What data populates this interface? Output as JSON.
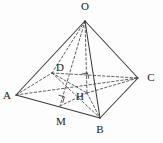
{
  "figure": {
    "stroke_color": "#3a3a3a",
    "label_color": "#1a1a1a",
    "background": "#fdfdfd",
    "vertices": [
      {
        "name": "O",
        "label": "O",
        "x": 85,
        "y": 21,
        "lx": 85,
        "ly": 7,
        "anchor": "middle"
      },
      {
        "name": "A",
        "label": "A",
        "x": 16,
        "y": 95,
        "lx": 7,
        "ly": 96,
        "anchor": "middle"
      },
      {
        "name": "B",
        "label": "B",
        "x": 100,
        "y": 118,
        "lx": 100,
        "ly": 130,
        "anchor": "middle"
      },
      {
        "name": "C",
        "label": "C",
        "x": 138,
        "y": 78,
        "lx": 151,
        "ly": 78,
        "anchor": "middle"
      },
      {
        "name": "D",
        "label": "D",
        "x": 52,
        "y": 73,
        "lx": 60,
        "ly": 68,
        "anchor": "middle"
      },
      {
        "name": "H",
        "label": "H",
        "x": 87,
        "y": 93,
        "lx": 80,
        "ly": 97,
        "anchor": "middle"
      },
      {
        "name": "M",
        "label": "M",
        "x": 60,
        "y": 106,
        "lx": 61,
        "ly": 122,
        "anchor": "middle"
      }
    ],
    "solid_edges": [
      {
        "name": "edge-OA",
        "from": "O",
        "to": "A"
      },
      {
        "name": "edge-OB",
        "from": "O",
        "to": "B"
      },
      {
        "name": "edge-OC",
        "from": "O",
        "to": "C"
      },
      {
        "name": "edge-AB",
        "from": "A",
        "to": "B"
      },
      {
        "name": "edge-BC",
        "from": "B",
        "to": "C"
      }
    ],
    "dashed_edges": [
      {
        "name": "edge-OD",
        "from": "O",
        "to": "D"
      },
      {
        "name": "edge-AD",
        "from": "A",
        "to": "D"
      },
      {
        "name": "edge-DC",
        "from": "D",
        "to": "C"
      },
      {
        "name": "edge-AC",
        "from": "A",
        "to": "C"
      },
      {
        "name": "edge-OH",
        "from": "O",
        "to": "H"
      },
      {
        "name": "edge-OM",
        "from": "O",
        "to": "M"
      },
      {
        "name": "edge-DH",
        "from": "D",
        "to": "H"
      },
      {
        "name": "edge-HC",
        "from": "H",
        "to": "C"
      },
      {
        "name": "edge-HM",
        "from": "H",
        "to": "M"
      },
      {
        "name": "edge-HB",
        "from": "H",
        "to": "B"
      },
      {
        "name": "edge-DB",
        "from": "D",
        "to": "B"
      }
    ],
    "right_angles": [
      {
        "name": "right-angle-at-H",
        "x": 83,
        "y": 80,
        "size": 6,
        "rotation": -14
      },
      {
        "name": "right-angle-at-M",
        "x": 57,
        "y": 101,
        "size": 6,
        "rotation": 15
      }
    ]
  }
}
